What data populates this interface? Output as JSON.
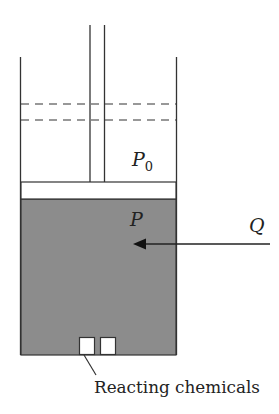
{
  "diagram": {
    "colors": {
      "line": "#333333",
      "gas_fill": "#8c8c8c",
      "piston_fill": "#ffffff",
      "background": "#ffffff"
    },
    "labels": {
      "ambient_pressure": "P",
      "ambient_pressure_sub": "0",
      "internal_pressure": "P",
      "heat": "Q",
      "chemicals": "Reacting chemicals"
    }
  }
}
